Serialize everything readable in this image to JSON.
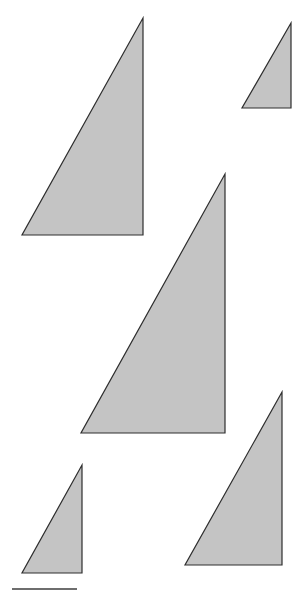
{
  "figure": {
    "fill_color": "#c4c4c4",
    "stroke_color": "#2e2e2e",
    "scale_bar_color": "#6e6e6e",
    "triangles": [
      {
        "id": "triangle-1",
        "points": "143,18 143,235 22,235"
      },
      {
        "id": "triangle-2",
        "points": "291,23 291,108 242,108"
      },
      {
        "id": "triangle-3",
        "points": "225,174 225,433 81,433"
      },
      {
        "id": "triangle-4",
        "points": "282,392 282,565 185,565"
      },
      {
        "id": "triangle-5",
        "points": "82,465 82,573 22,573"
      }
    ],
    "scale_bar": {
      "x1": 12,
      "y1": 589,
      "x2": 77,
      "y2": 589
    }
  }
}
